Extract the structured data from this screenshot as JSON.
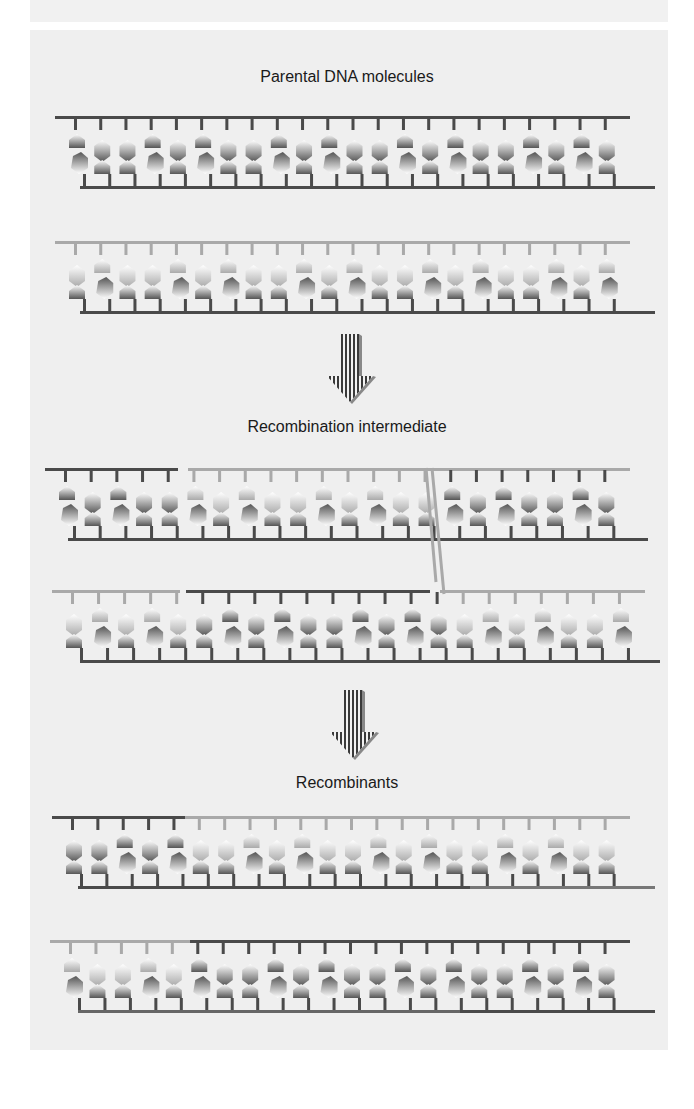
{
  "figure": {
    "stages": [
      {
        "label": "Parental DNA molecules"
      },
      {
        "label": "Recombination intermediate"
      },
      {
        "label": "Recombinants"
      }
    ],
    "arrows": [
      "down-arrow",
      "down-arrow"
    ]
  },
  "colors": {
    "background": "#ffffff",
    "panel": "#efefef",
    "dark_strand": "#4a4a4a",
    "light_strand": "#a9a9a9",
    "text": "#1a1a1a"
  },
  "molecules": [
    {
      "stage": 0,
      "id": "parental-dark",
      "top": 118,
      "x1_top": 55,
      "x2_top": 630,
      "x1_bot": 80,
      "x2_bot": 655,
      "top_color": "dark",
      "bot_color": "dark"
    },
    {
      "stage": 0,
      "id": "parental-light",
      "top": 243,
      "x1_top": 55,
      "x2_top": 630,
      "x1_bot": 80,
      "x2_bot": 655,
      "top_color": "light",
      "bot_color": "dark"
    },
    {
      "stage": 1,
      "id": "intermediate-1",
      "top": 470,
      "x1_top": 45,
      "x2_top": 630,
      "x1_bot": 68,
      "x2_bot": 648,
      "top_color": "mixed1",
      "bot_color": "dark"
    },
    {
      "stage": 1,
      "id": "intermediate-2",
      "top": 592,
      "x1_top": 52,
      "x2_top": 645,
      "x1_bot": 80,
      "x2_bot": 660,
      "top_color": "mixed2",
      "bot_color": "dark"
    },
    {
      "stage": 2,
      "id": "recombinant-1",
      "top": 818,
      "x1_top": 52,
      "x2_top": 630,
      "x1_bot": 78,
      "x2_bot": 655,
      "top_color": "mixed3",
      "bot_color": "mixed4"
    },
    {
      "stage": 2,
      "id": "recombinant-2",
      "top": 942,
      "x1_top": 50,
      "x2_top": 630,
      "x1_bot": 78,
      "x2_bot": 655,
      "top_color": "mixed5",
      "bot_color": "mixed6"
    }
  ]
}
